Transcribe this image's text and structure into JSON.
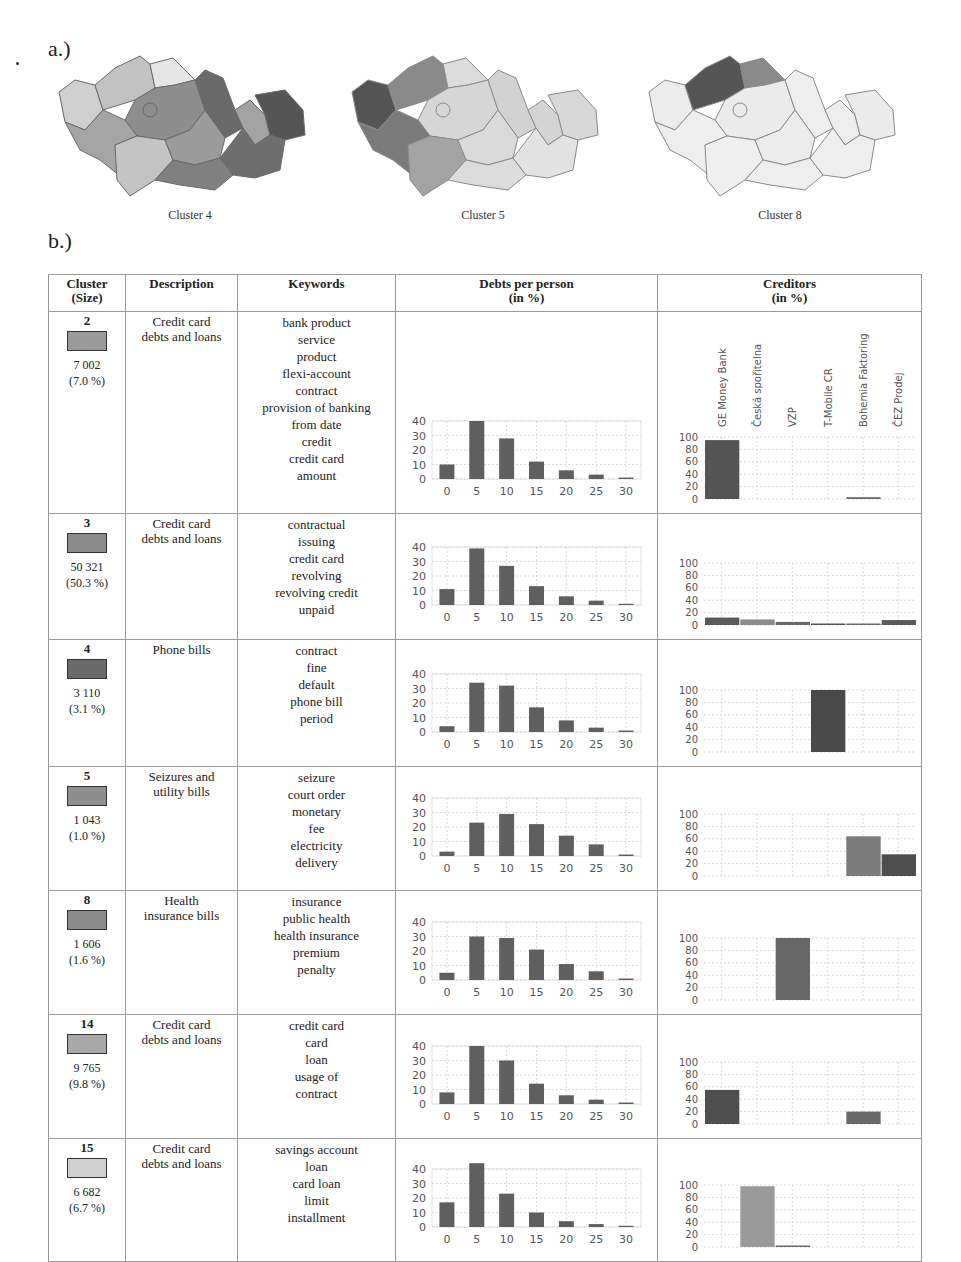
{
  "figure": {
    "part_a_label": "a.)",
    "part_b_label": "b.)",
    "maps": [
      {
        "caption": "Cluster 4"
      },
      {
        "caption": "Cluster 5"
      },
      {
        "caption": "Cluster 8"
      }
    ]
  },
  "table": {
    "headers": {
      "cluster": [
        "Cluster",
        "(Size)"
      ],
      "description": "Description",
      "keywords": "Keywords",
      "debts": [
        "Debts per person",
        "(in %)"
      ],
      "creditors": [
        "Creditors",
        "(in %)"
      ]
    },
    "rows": [
      {
        "id": "2",
        "swatch": "#9a9a9a",
        "count": "7 002",
        "pct": "(7.0 %)",
        "description": [
          "Credit card",
          "debts and loans"
        ],
        "keywords": [
          "bank product",
          "service",
          "product",
          "flexi-account",
          "contract",
          "provision of banking",
          "from date",
          "credit",
          "credit card",
          "amount"
        ]
      },
      {
        "id": "3",
        "swatch": "#8a8a8a",
        "count": "50 321",
        "pct": "(50.3 %)",
        "description": [
          "Credit card",
          "debts and loans"
        ],
        "keywords": [
          "contractual",
          "issuing",
          "credit card",
          "revolving",
          "revolving credit",
          "unpaid"
        ]
      },
      {
        "id": "4",
        "swatch": "#6a6a6a",
        "count": "3 110",
        "pct": "(3.1 %)",
        "description": [
          "Phone bills"
        ],
        "keywords": [
          "contract",
          "fine",
          "default",
          "phone bill",
          "period"
        ]
      },
      {
        "id": "5",
        "swatch": "#8e8e8e",
        "count": "1 043",
        "pct": "(1.0 %)",
        "description": [
          "Seizures and",
          "utility bills"
        ],
        "keywords": [
          "seizure",
          "court order",
          "monetary",
          "fee",
          "electricity",
          "delivery"
        ]
      },
      {
        "id": "8",
        "swatch": "#8a8a8a",
        "count": "1 606",
        "pct": "(1.6 %)",
        "description": [
          "Health",
          "insurance bills"
        ],
        "keywords": [
          "insurance",
          "public health",
          "health insurance",
          "premium",
          "penalty"
        ]
      },
      {
        "id": "14",
        "swatch": "#a8a8a8",
        "count": "9 765",
        "pct": "(9.8 %)",
        "description": [
          "Credit card",
          "debts and loans"
        ],
        "keywords": [
          "credit card",
          "card",
          "loan",
          "usage of",
          "contract"
        ]
      },
      {
        "id": "15",
        "swatch": "#cfcfcf",
        "count": "6 682",
        "pct": "(6.7 %)",
        "description": [
          "Credit card",
          "debts and loans"
        ],
        "keywords": [
          "savings account",
          "loan",
          "card loan",
          "limit",
          "installment"
        ]
      }
    ]
  },
  "chart_data": [
    {
      "type": "bar",
      "title": "Debts per person (in %) - Cluster 2",
      "categories": [
        "0",
        "5",
        "10",
        "15",
        "20",
        "25",
        "30"
      ],
      "values": [
        10,
        40,
        28,
        12,
        6,
        3,
        1
      ],
      "ylim": [
        0,
        40
      ],
      "yticks": [
        0,
        10,
        20,
        30,
        40
      ],
      "grid": true
    },
    {
      "type": "bar",
      "title": "Creditors (in %) - Cluster 2",
      "categories": [
        "GE Money Bank",
        "Česká spořitelna",
        "VZP",
        "T-Mobile CR",
        "Bohemia Faktoring",
        "ČEZ Prodej"
      ],
      "values": [
        95,
        0,
        0,
        0,
        3,
        0
      ],
      "ylim": [
        0,
        100
      ],
      "yticks": [
        0,
        20,
        40,
        60,
        80,
        100
      ],
      "grid": true
    },
    {
      "type": "bar",
      "title": "Debts per person (in %) - Cluster 3",
      "categories": [
        "0",
        "5",
        "10",
        "15",
        "20",
        "25",
        "30"
      ],
      "values": [
        11,
        39,
        27,
        13,
        6,
        3,
        0.5
      ],
      "ylim": [
        0,
        40
      ],
      "yticks": [
        0,
        10,
        20,
        30,
        40
      ],
      "grid": true
    },
    {
      "type": "bar",
      "title": "Creditors (in %) - Cluster 3",
      "categories": [
        "GE Money Bank",
        "Česká spořitelna",
        "VZP",
        "T-Mobile CR",
        "Bohemia Faktoring",
        "ČEZ Prodej"
      ],
      "values": [
        12,
        9,
        5,
        1,
        2,
        8
      ],
      "ylim": [
        0,
        100
      ],
      "yticks": [
        0,
        20,
        40,
        60,
        80,
        100
      ],
      "grid": true
    },
    {
      "type": "bar",
      "title": "Debts per person (in %) - Cluster 4",
      "categories": [
        "0",
        "5",
        "10",
        "15",
        "20",
        "25",
        "30"
      ],
      "values": [
        4,
        34,
        32,
        17,
        8,
        3,
        1
      ],
      "ylim": [
        0,
        40
      ],
      "yticks": [
        0,
        10,
        20,
        30,
        40
      ],
      "grid": true
    },
    {
      "type": "bar",
      "title": "Creditors (in %) - Cluster 4",
      "categories": [
        "GE Money Bank",
        "Česká spořitelna",
        "VZP",
        "T-Mobile CR",
        "Bohemia Faktoring",
        "ČEZ Prodej"
      ],
      "values": [
        0,
        0,
        0,
        100,
        0,
        0
      ],
      "ylim": [
        0,
        100
      ],
      "yticks": [
        0,
        20,
        40,
        60,
        80,
        100
      ],
      "grid": true
    },
    {
      "type": "bar",
      "title": "Debts per person (in %) - Cluster 5",
      "categories": [
        "0",
        "5",
        "10",
        "15",
        "20",
        "25",
        "30"
      ],
      "values": [
        3,
        23,
        29,
        22,
        14,
        8,
        1
      ],
      "ylim": [
        0,
        40
      ],
      "yticks": [
        0,
        10,
        20,
        30,
        40
      ],
      "grid": true
    },
    {
      "type": "bar",
      "title": "Creditors (in %) - Cluster 5",
      "categories": [
        "GE Money Bank",
        "Česká spořitelna",
        "VZP",
        "T-Mobile CR",
        "Bohemia Faktoring",
        "ČEZ Prodej"
      ],
      "values": [
        0,
        0,
        0,
        0,
        64,
        35
      ],
      "ylim": [
        0,
        100
      ],
      "yticks": [
        0,
        20,
        40,
        60,
        80,
        100
      ],
      "grid": true
    },
    {
      "type": "bar",
      "title": "Debts per person (in %) - Cluster 8",
      "categories": [
        "0",
        "5",
        "10",
        "15",
        "20",
        "25",
        "30"
      ],
      "values": [
        5,
        30,
        29,
        21,
        11,
        6,
        1
      ],
      "ylim": [
        0,
        40
      ],
      "yticks": [
        0,
        10,
        20,
        30,
        40
      ],
      "grid": true
    },
    {
      "type": "bar",
      "title": "Creditors (in %) - Cluster 8",
      "categories": [
        "GE Money Bank",
        "Česká spořitelna",
        "VZP",
        "T-Mobile CR",
        "Bohemia Faktoring",
        "ČEZ Prodej"
      ],
      "values": [
        0,
        0,
        100,
        0,
        0,
        0
      ],
      "ylim": [
        0,
        100
      ],
      "yticks": [
        0,
        20,
        40,
        60,
        80,
        100
      ],
      "grid": true
    },
    {
      "type": "bar",
      "title": "Debts per person (in %) - Cluster 14",
      "categories": [
        "0",
        "5",
        "10",
        "15",
        "20",
        "25",
        "30"
      ],
      "values": [
        8,
        40,
        30,
        14,
        6,
        3,
        1
      ],
      "ylim": [
        0,
        40
      ],
      "yticks": [
        0,
        10,
        20,
        30,
        40
      ],
      "grid": true
    },
    {
      "type": "bar",
      "title": "Creditors (in %) - Cluster 14",
      "categories": [
        "GE Money Bank",
        "Česká spořitelna",
        "VZP",
        "T-Mobile CR",
        "Bohemia Faktoring",
        "ČEZ Prodej"
      ],
      "values": [
        55,
        0,
        0,
        0,
        20,
        0
      ],
      "ylim": [
        0,
        100
      ],
      "yticks": [
        0,
        20,
        40,
        60,
        80,
        100
      ],
      "grid": true
    },
    {
      "type": "bar",
      "title": "Debts per person (in %) - Cluster 15",
      "categories": [
        "0",
        "5",
        "10",
        "15",
        "20",
        "25",
        "30"
      ],
      "values": [
        17,
        44,
        23,
        10,
        4,
        2,
        0.5
      ],
      "ylim": [
        0,
        40
      ],
      "yticks": [
        0,
        10,
        20,
        30,
        40
      ],
      "grid": true
    },
    {
      "type": "bar",
      "title": "Creditors (in %) - Cluster 15",
      "categories": [
        "GE Money Bank",
        "Česká spořitelna",
        "VZP",
        "T-Mobile CR",
        "Bohemia Faktoring",
        "ČEZ Prodej"
      ],
      "values": [
        0,
        98,
        1,
        0,
        0,
        0
      ],
      "ylim": [
        0,
        100
      ],
      "yticks": [
        0,
        20,
        40,
        60,
        80,
        100
      ],
      "grid": true
    }
  ],
  "creditor_bar_colors": [
    [
      "#555555",
      "#555555",
      "#555555",
      "#555555",
      "#6d6d6d",
      "#555555"
    ],
    [
      "#5a5a5a",
      "#8c8c8c",
      "#6a6a6a",
      "#555555",
      "#6a6a6a",
      "#5a5a5a"
    ],
    [
      "#555555",
      "#555555",
      "#555555",
      "#4a4a4a",
      "#555555",
      "#555555"
    ],
    [
      "#555555",
      "#555555",
      "#555555",
      "#555555",
      "#7a7a7a",
      "#4e4e4e"
    ],
    [
      "#555555",
      "#555555",
      "#686868",
      "#555555",
      "#555555",
      "#555555"
    ],
    [
      "#4e4e4e",
      "#555555",
      "#555555",
      "#555555",
      "#6a6a6a",
      "#555555"
    ],
    [
      "#555555",
      "#9a9a9a",
      "#6a6a6a",
      "#555555",
      "#555555",
      "#555555"
    ]
  ],
  "creditor_label_row": 0
}
